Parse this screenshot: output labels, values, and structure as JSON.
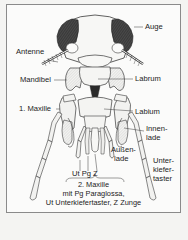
{
  "diagram": {
    "colors": {
      "background": "#f4f4f2",
      "panel": "#fbfbfa",
      "frame": "#8a8a8a",
      "ink": "#1c1c1c",
      "eye_shade": "#3a3a3a",
      "part_fill": "#f1f1ef"
    },
    "labels": {
      "auge": "Auge",
      "antenne": "Antenne",
      "mandibel": "Mandibel",
      "labrum": "Labrum",
      "maxille1": "1. Maxille",
      "labium": "Labium",
      "innenlade_1": "Innen-",
      "innenlade_2": "lade",
      "aussenlade_1": "Außen-",
      "aussenlade_2": "lade",
      "unterkiefertaster_1": "Unter-",
      "unterkiefertaster_2": "kiefer-",
      "unterkiefertaster_3": "taster",
      "ut_pg_z": "Ut Pg Z"
    },
    "caption": {
      "line1": "2. Maxille",
      "line2": "mit Pg Paraglossa,",
      "line3": "Ut Unterkiefertaster,  Z Zunge"
    }
  }
}
